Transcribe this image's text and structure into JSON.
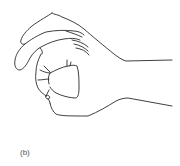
{
  "figure": {
    "panel_label": "(b)",
    "stroke_color": "#2a2a2a",
    "background_color": "#ffffff"
  }
}
